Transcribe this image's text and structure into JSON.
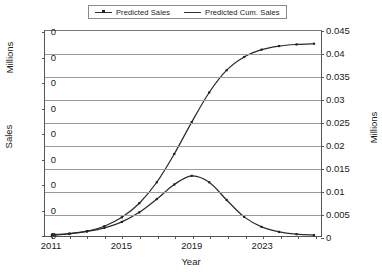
{
  "chart_data": {
    "type": "line",
    "title": "",
    "xlabel": "Year",
    "ylabel_left": "Sales",
    "ylabel_left_units": "Millions",
    "ylabel_right_units": "Millions",
    "grid": true,
    "legend_position": "top-center",
    "x": [
      2011,
      2012,
      2013,
      2014,
      2015,
      2016,
      2017,
      2018,
      2019,
      2020,
      2021,
      2022,
      2023,
      2024,
      2025,
      2026
    ],
    "xlim": [
      2010.6,
      2026.4
    ],
    "xticks_labeled": [
      "2011",
      "2015",
      "2019",
      "2023"
    ],
    "xtick_values_labeled": [
      2011,
      2015,
      2019,
      2023
    ],
    "xticks_all": [
      2011,
      2012,
      2013,
      2014,
      2015,
      2016,
      2017,
      2018,
      2019,
      2020,
      2021,
      2022,
      2023,
      2024,
      2025,
      2026
    ],
    "yticks_left_labels": [
      "0",
      "0",
      "0",
      "0",
      "0",
      "0",
      "0",
      "0",
      "0"
    ],
    "ylim_right": [
      0,
      0.045
    ],
    "yticks_right": [
      0,
      0.005,
      0.01,
      0.015,
      0.02,
      0.025,
      0.03,
      0.035,
      0.04,
      0.045
    ],
    "yticks_right_labels": [
      "0",
      "0.005",
      "0.01",
      "0.015",
      "0.02",
      "0.025",
      "0.03",
      "0.035",
      "0.04",
      "0.045"
    ],
    "series": [
      {
        "name": "Predicted Sales",
        "axis": "left",
        "markers": true,
        "values": [
          0.0003,
          0.00055,
          0.001,
          0.0018,
          0.0031,
          0.0052,
          0.0081,
          0.0113,
          0.0132,
          0.0118,
          0.0079,
          0.0042,
          0.002,
          0.0009,
          0.0004,
          0.0002
        ]
      },
      {
        "name": "Predicted Cum. Sales",
        "axis": "right",
        "markers": true,
        "values": [
          0.00015,
          0.00045,
          0.00105,
          0.00215,
          0.0041,
          0.0072,
          0.0118,
          0.018,
          0.025,
          0.0315,
          0.0364,
          0.0393,
          0.0409,
          0.0417,
          0.04205,
          0.0422
        ]
      }
    ]
  },
  "legend": {
    "items": [
      {
        "label": "Predicted Sales"
      },
      {
        "label": "Predicted Cum. Sales"
      }
    ]
  },
  "axes": {
    "x_title": "Year",
    "left_title_upper": "Millions",
    "left_title_lower": "Sales",
    "right_title": "Millions"
  },
  "colors": {
    "series_line": "#2b2b2b",
    "gridline": "#9a9a9a",
    "frame": "#555555",
    "background": "#ffffff"
  }
}
